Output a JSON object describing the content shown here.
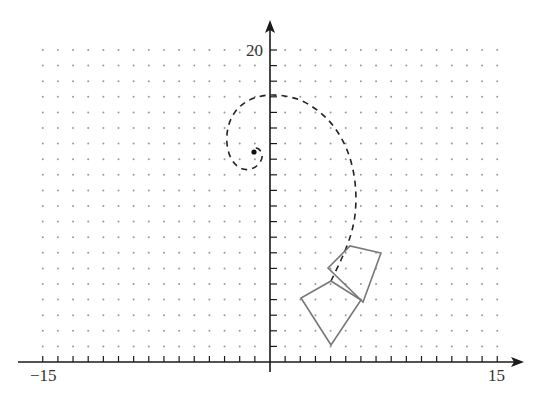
{
  "diagram": {
    "type": "coordinate-plane-transformation",
    "x_axis": {
      "min": -15,
      "max": 15,
      "labels": [
        {
          "value": -15,
          "text": "−15"
        },
        {
          "value": 15,
          "text": "15"
        }
      ]
    },
    "y_axis": {
      "min": 0,
      "max": 20,
      "labels": [
        {
          "value": 20,
          "text": "20"
        }
      ]
    },
    "grid": {
      "style": "dotted",
      "x_range": [
        -15,
        15
      ],
      "y_range": [
        1,
        20
      ]
    },
    "center_point": {
      "x": -1,
      "y": 13.5
    },
    "shapes": [
      {
        "name": "square-1",
        "vertices": [
          [
            4,
            1
          ],
          [
            2,
            4
          ],
          [
            4,
            5.3
          ],
          [
            6,
            4
          ]
        ]
      },
      {
        "name": "square-2",
        "vertices": [
          [
            3.8,
            6
          ],
          [
            5.3,
            7.5
          ],
          [
            7.3,
            7.1
          ],
          [
            6.2,
            3.9
          ]
        ]
      }
    ],
    "spiral_path": "dashed"
  },
  "labels": {
    "x_min": "−15",
    "x_max": "15",
    "y_max": "20"
  },
  "colors": {
    "axis": "#1a1a1a",
    "grid_dot": "#9a9a9a",
    "shape_stroke": "#777777",
    "spiral": "#222222"
  }
}
